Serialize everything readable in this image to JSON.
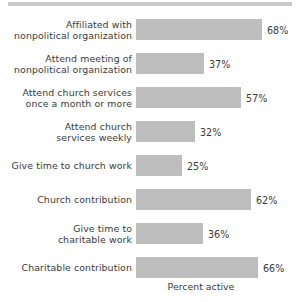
{
  "figure": {
    "top_rule_color": "#c9c9c9",
    "background": "#ffffff",
    "bar_color": "#bdbdbd",
    "text_color": "#3a3a3a"
  },
  "axis": {
    "title": "Percent active"
  },
  "chart_data": {
    "type": "bar",
    "orientation": "horizontal",
    "title": "",
    "subtitle": "",
    "xlabel": "Percent active",
    "ylabel": "",
    "xlim": [
      0,
      100
    ],
    "grid": false,
    "legend": null,
    "value_suffix": "%",
    "categories": [
      "Affiliated with\nnonpolitical organization",
      "Attend meeting of\nnonpolitical organization",
      "Attend church services\nonce a month or more",
      "Attend church\nservices weekly",
      "Give time to church work",
      "Church contribution",
      "Give time to\ncharitable work",
      "Charitable contribution"
    ],
    "values": [
      68,
      37,
      57,
      32,
      25,
      62,
      36,
      66
    ],
    "value_labels": [
      "68%",
      "37%",
      "57%",
      "32%",
      "25%",
      "62%",
      "36%",
      "66%"
    ]
  }
}
